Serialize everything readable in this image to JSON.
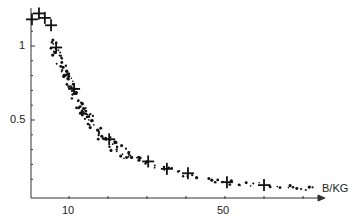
{
  "chart_data": {
    "type": "scatter",
    "title": "",
    "xlabel": "B/KG",
    "ylabel": "",
    "xlim": [
      0,
      76
    ],
    "ylim": [
      0,
      1.25
    ],
    "x_ticks_labeled": [
      10,
      50
    ],
    "x_tick_step": 10,
    "y_ticks_labeled": [
      0.5,
      1
    ],
    "y_tick_step": 0.1,
    "grid": false,
    "legend": null,
    "series": [
      {
        "name": "measured points (crosses)",
        "marker": "plus",
        "x": [
          0.5,
          2.3,
          3.8,
          5.4,
          6.7,
          11.3,
          20.3,
          30.3,
          35.1,
          40.5,
          50.5,
          60.0
        ],
        "y": [
          1.18,
          1.22,
          1.19,
          1.14,
          0.99,
          0.71,
          0.37,
          0.22,
          0.17,
          0.14,
          0.08,
          0.06
        ]
      },
      {
        "name": "scatter cloud (dots)",
        "marker": "dot",
        "x": [
          6.0,
          6.5,
          7.0,
          7.5,
          8.0,
          8.5,
          9.0,
          9.5,
          10.0,
          10.5,
          11.0,
          11.5,
          12.0,
          12.5,
          13.0,
          13.5,
          14.0,
          14.5,
          15.0,
          15.5,
          16.0,
          17.0,
          18.0,
          19.0,
          20.0,
          21.0,
          22.0,
          23.0,
          24.0,
          25.0,
          26.0,
          28.0,
          30.0,
          32.0,
          34.0,
          36.0,
          38.0,
          40.0,
          42.0,
          46.0,
          48.0,
          50.0,
          52.0,
          54.0,
          56.0,
          58.0,
          62.0,
          64.0,
          66.0,
          68.0,
          70.0,
          72.0
        ],
        "y": [
          1.02,
          0.98,
          0.95,
          0.92,
          0.88,
          0.85,
          0.82,
          0.79,
          0.76,
          0.73,
          0.7,
          0.67,
          0.64,
          0.62,
          0.59,
          0.57,
          0.55,
          0.53,
          0.51,
          0.49,
          0.47,
          0.44,
          0.41,
          0.38,
          0.36,
          0.34,
          0.32,
          0.3,
          0.28,
          0.27,
          0.25,
          0.23,
          0.21,
          0.19,
          0.17,
          0.16,
          0.15,
          0.13,
          0.12,
          0.1,
          0.09,
          0.08,
          0.08,
          0.07,
          0.06,
          0.06,
          0.05,
          0.05,
          0.05,
          0.04,
          0.04,
          0.04
        ]
      }
    ]
  },
  "labels": {
    "x_axis": "B/KG",
    "x_tick_10": "10",
    "x_tick_50": "50",
    "y_tick_1": "1",
    "y_tick_05": "0.5"
  }
}
